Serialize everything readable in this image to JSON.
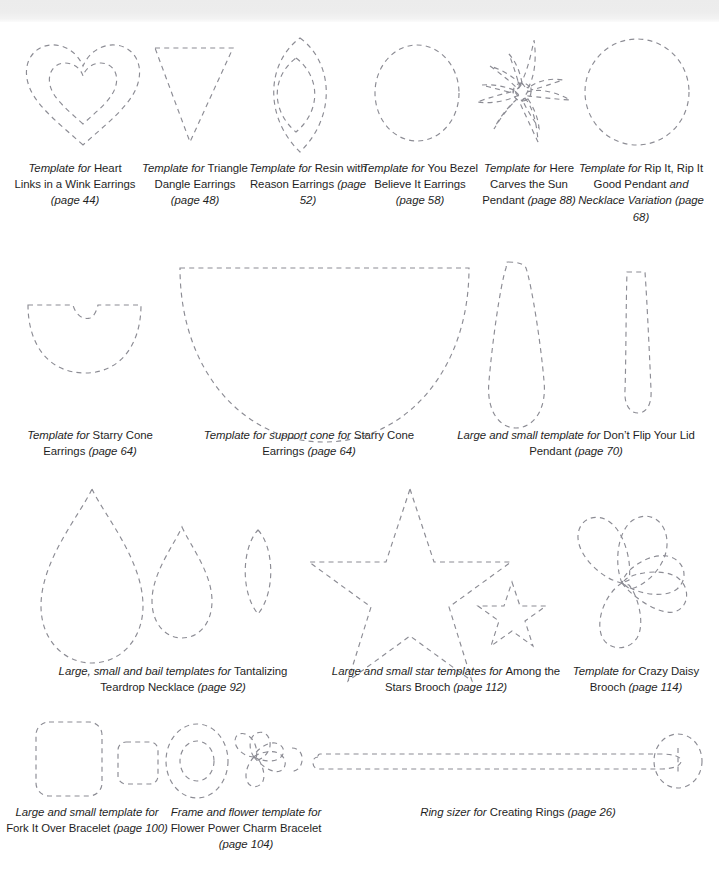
{
  "page": {
    "background_color": "#ffffff",
    "stroke_color": "#8c8c94",
    "top_band_color": "#ececec"
  },
  "captions": {
    "heart": {
      "em1": "Template for ",
      "rest": "Heart Links in a Wink Earrings ",
      "em2": "(page 44)"
    },
    "triangle": {
      "em1": "Template for ",
      "rest": "Triangle Dangle Earrings ",
      "em2": "(page 48)"
    },
    "resin": {
      "em1": "Template for ",
      "rest": "Resin with Reason Earrings ",
      "em2": "(page 52)"
    },
    "bezel": {
      "em1": "Template for ",
      "rest": "You Bezel Believe It Earrings ",
      "em2": "(page 58)"
    },
    "sun": {
      "em1": "Template for ",
      "rest": "Here Carves the Sun Pendant ",
      "em2": "(page 88)"
    },
    "rip": {
      "em1": "Template for ",
      "rest": "Rip It, Rip It Good Pendant ",
      "em2": "and Necklace Variation (page 68)"
    },
    "starry": {
      "em1": "Template for ",
      "rest": "Starry Cone Earrings ",
      "em2": "(page 64)"
    },
    "support": {
      "em1": "Template for support cone for ",
      "rest": "Starry Cone Earrings ",
      "em2": "(page 64)"
    },
    "dont": {
      "em1": "Large and small template for ",
      "rest": "Don’t Flip Your Lid Pendant ",
      "em2": "(page 70)"
    },
    "tantalizing": {
      "em1": "Large, small and bail templates for ",
      "rest": "Tantalizing Teardrop Necklace ",
      "em2": "(page 92)"
    },
    "stars": {
      "em1": "Large and small star templates for ",
      "rest": "Among the Stars Brooch ",
      "em2": "(page 112)"
    },
    "daisy": {
      "em1": "Template for ",
      "rest": "Crazy Daisy Brooch ",
      "em2": "(page 114)"
    },
    "fork": {
      "em1": "Large and small template for ",
      "rest": "Fork It Over Bracelet ",
      "em2": "(page 100)"
    },
    "flower": {
      "em1": "Frame and flower template for ",
      "rest": "Flower Power Charm Bracelet ",
      "em2": "(page 104)"
    },
    "ring": {
      "em1": "Ring sizer for ",
      "rest": "Creating Rings ",
      "em2": "(page 26)"
    }
  },
  "shapes": [
    {
      "name": "heart-outer",
      "row": 1
    },
    {
      "name": "heart-inner",
      "row": 1
    },
    {
      "name": "triangle-dangle",
      "row": 1
    },
    {
      "name": "resin-leaf-outer",
      "row": 1
    },
    {
      "name": "resin-leaf-inner",
      "row": 1
    },
    {
      "name": "bezel-circle",
      "row": 1
    },
    {
      "name": "sunburst",
      "row": 1
    },
    {
      "name": "rip-it-oval",
      "row": 1
    },
    {
      "name": "starry-cone-half-disc",
      "row": 2
    },
    {
      "name": "support-cone-half-disc",
      "row": 2
    },
    {
      "name": "lid-teardrop-large",
      "row": 2
    },
    {
      "name": "lid-teardrop-small",
      "row": 2
    },
    {
      "name": "teardrop-large",
      "row": 3
    },
    {
      "name": "teardrop-small",
      "row": 3
    },
    {
      "name": "teardrop-bail",
      "row": 3
    },
    {
      "name": "star-large",
      "row": 3
    },
    {
      "name": "star-small",
      "row": 3
    },
    {
      "name": "daisy-flower",
      "row": 3
    },
    {
      "name": "fork-square-large",
      "row": 4
    },
    {
      "name": "fork-square-small",
      "row": 4
    },
    {
      "name": "frame-ring-outer",
      "row": 4
    },
    {
      "name": "frame-ring-inner",
      "row": 4
    },
    {
      "name": "charm-flower",
      "row": 4
    },
    {
      "name": "ring-sizer-strip",
      "row": 4
    }
  ]
}
